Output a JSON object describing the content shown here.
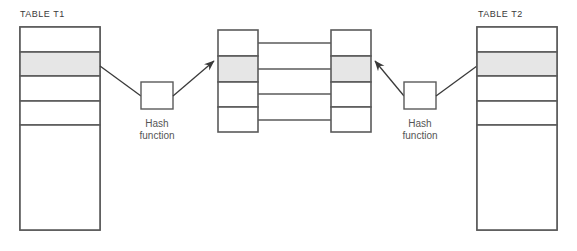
{
  "diagram": {
    "colors": {
      "stroke": "#5a5a5a",
      "shaded_cell": "#e6e6e6",
      "background": "#ffffff",
      "text": "#3a3a3a",
      "label_text": "#555555"
    },
    "left_table": {
      "label": "TABLE T1",
      "rows": [
        {
          "id": "t1-row-1",
          "shaded": false
        },
        {
          "id": "t1-row-2",
          "shaded": true
        },
        {
          "id": "t1-row-3",
          "shaded": false
        },
        {
          "id": "t1-row-4",
          "shaded": false
        },
        {
          "id": "t1-row-5",
          "shaded": false
        }
      ]
    },
    "right_table": {
      "label": "TABLE T2",
      "rows": [
        {
          "id": "t2-row-1",
          "shaded": false
        },
        {
          "id": "t2-row-2",
          "shaded": true
        },
        {
          "id": "t2-row-3",
          "shaded": false
        },
        {
          "id": "t2-row-4",
          "shaded": false
        },
        {
          "id": "t2-row-5",
          "shaded": false
        }
      ]
    },
    "left_hash": {
      "line1": "Hash",
      "line2": "function"
    },
    "right_hash": {
      "line1": "Hash",
      "line2": "function"
    },
    "left_buckets": {
      "cells": [
        {
          "id": "lb-cell-1",
          "shaded": false
        },
        {
          "id": "lb-cell-2",
          "shaded": true
        },
        {
          "id": "lb-cell-3",
          "shaded": false
        },
        {
          "id": "lb-cell-4",
          "shaded": false
        }
      ]
    },
    "right_buckets": {
      "cells": [
        {
          "id": "rb-cell-1",
          "shaded": false
        },
        {
          "id": "rb-cell-2",
          "shaded": true
        },
        {
          "id": "rb-cell-3",
          "shaded": false
        },
        {
          "id": "rb-cell-4",
          "shaded": false
        }
      ]
    },
    "connector_count": 4
  }
}
